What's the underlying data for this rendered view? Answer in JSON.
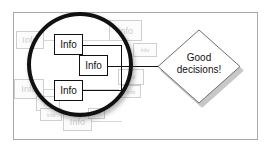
{
  "figure": {
    "frame_border_color": "#a8a8a8",
    "background_color": "#ffffff",
    "accent_color": "#111111",
    "ghost_color": "#cccccc"
  },
  "magnifier": {
    "name": "magnifying-lens",
    "stroke_color": "#111111"
  },
  "focused_nodes": [
    {
      "label": "Info"
    },
    {
      "label": "Info"
    },
    {
      "label": "Info"
    }
  ],
  "background_nodes": [
    {
      "label": "Info"
    },
    {
      "label": "Info"
    },
    {
      "label": "Info"
    },
    {
      "label": "info"
    },
    {
      "label": "Info"
    },
    {
      "label": "Info"
    },
    {
      "label": "Info"
    },
    {
      "label": "info"
    },
    {
      "label": "Info"
    },
    {
      "label": "info"
    }
  ],
  "outcome": {
    "shape": "diamond",
    "line1": "Good",
    "line2": "decisions!",
    "text": "Good decisions!"
  }
}
